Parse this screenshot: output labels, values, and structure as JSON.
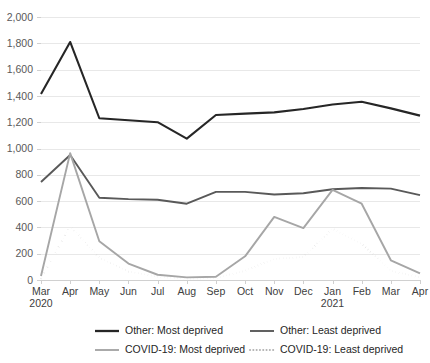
{
  "chart_data": {
    "type": "line",
    "title": "",
    "subtitle": "",
    "xlabel": "",
    "ylabel": "",
    "ylim": [
      0,
      2000
    ],
    "y_tick_step": 200,
    "grid": true,
    "legend_position": "bottom",
    "categories": [
      "Mar",
      "Apr",
      "May",
      "Jun",
      "Jul",
      "Aug",
      "Sep",
      "Oct",
      "Nov",
      "Dec",
      "Jan",
      "Feb",
      "Mar",
      "Apr"
    ],
    "year_labels": [
      {
        "category": "Mar",
        "year": "2020"
      },
      {
        "category": "Jan",
        "year": "2021"
      }
    ],
    "ytick_labels": [
      "0",
      "200",
      "400",
      "600",
      "800",
      "1,000",
      "1,200",
      "1,400",
      "1,600",
      "1,800",
      "2,000"
    ],
    "series": [
      {
        "name": "Other: Most deprived",
        "color": "#262626",
        "style": "solid",
        "width": 2.1,
        "values": [
          1415,
          1810,
          1230,
          1215,
          1200,
          1075,
          1255,
          1265,
          1275,
          1300,
          1335,
          1355,
          1305,
          1250
        ]
      },
      {
        "name": "Other: Least deprived",
        "color": "#595959",
        "style": "solid",
        "width": 1.9,
        "values": [
          745,
          950,
          625,
          615,
          610,
          580,
          670,
          670,
          650,
          660,
          690,
          700,
          695,
          645
        ]
      },
      {
        "name": "COVID-19: Most deprived",
        "color": "#a6a6a6",
        "style": "solid",
        "width": 1.9,
        "values": [
          30,
          965,
          295,
          125,
          40,
          20,
          25,
          180,
          480,
          395,
          685,
          580,
          150,
          50
        ]
      },
      {
        "name": "COVID-19: Least deprived",
        "color": "#b3b3b3",
        "style": "dotted",
        "width": 2.0,
        "values": [
          10,
          410,
          170,
          65,
          25,
          10,
          15,
          70,
          160,
          175,
          390,
          275,
          70,
          20
        ]
      }
    ]
  },
  "legend": {
    "entries": [
      {
        "label": "Other: Most deprived",
        "color": "#262626",
        "style": "solid"
      },
      {
        "label": "Other: Least deprived",
        "color": "#595959",
        "style": "solid"
      },
      {
        "label": "COVID-19: Most deprived",
        "color": "#a6a6a6",
        "style": "solid"
      },
      {
        "label": "COVID-19: Least deprived",
        "color": "#b3b3b3",
        "style": "dotted"
      }
    ]
  }
}
